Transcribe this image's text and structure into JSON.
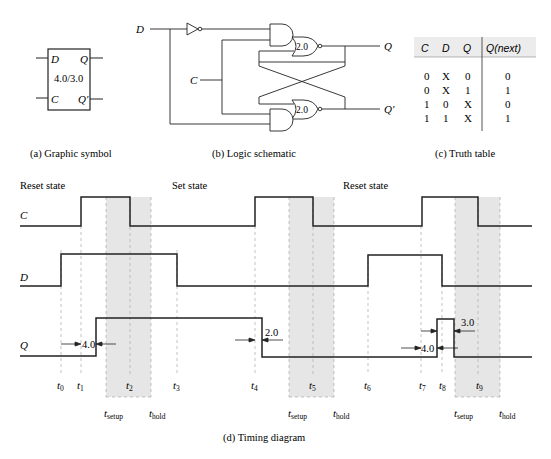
{
  "symbol": {
    "inputs": [
      "D",
      "C"
    ],
    "outputs": [
      "Q",
      "Q′"
    ],
    "delay_label": "4.0/3.0",
    "caption": "(a)  Graphic symbol"
  },
  "schematic": {
    "input_d": "D",
    "input_c": "C",
    "output_q": "Q",
    "output_qbar": "Q′",
    "nor_top_delay": "2.0",
    "nor_bottom_delay": "2.0",
    "caption": "(b)  Logic schematic"
  },
  "truth_table": {
    "headers": [
      "C",
      "D",
      "Q",
      "Q(next)"
    ],
    "rows": [
      [
        "0",
        "X",
        "0",
        "0"
      ],
      [
        "0",
        "X",
        "1",
        "1"
      ],
      [
        "1",
        "0",
        "X",
        "0"
      ],
      [
        "1",
        "1",
        "X",
        "1"
      ]
    ],
    "caption": "(c)  Truth table"
  },
  "timing": {
    "state_labels": [
      "Reset state",
      "Set state",
      "Reset state"
    ],
    "signals": [
      "C",
      "D",
      "Q"
    ],
    "time_markers": [
      "t0",
      "t1",
      "t2",
      "t3",
      "t4",
      "t5",
      "t6",
      "t7",
      "t8",
      "t9"
    ],
    "setup_label": "setup",
    "hold_label": "hold",
    "t_label": "t",
    "delays": [
      "4.0",
      "2.0",
      "4.0",
      "3.0"
    ],
    "caption": "(d)  Timing diagram"
  },
  "colors": {
    "line": "#222222",
    "dashed": "#aaaaaa",
    "shade": "#e6e6e6",
    "table_header_bg": "#ececec"
  }
}
